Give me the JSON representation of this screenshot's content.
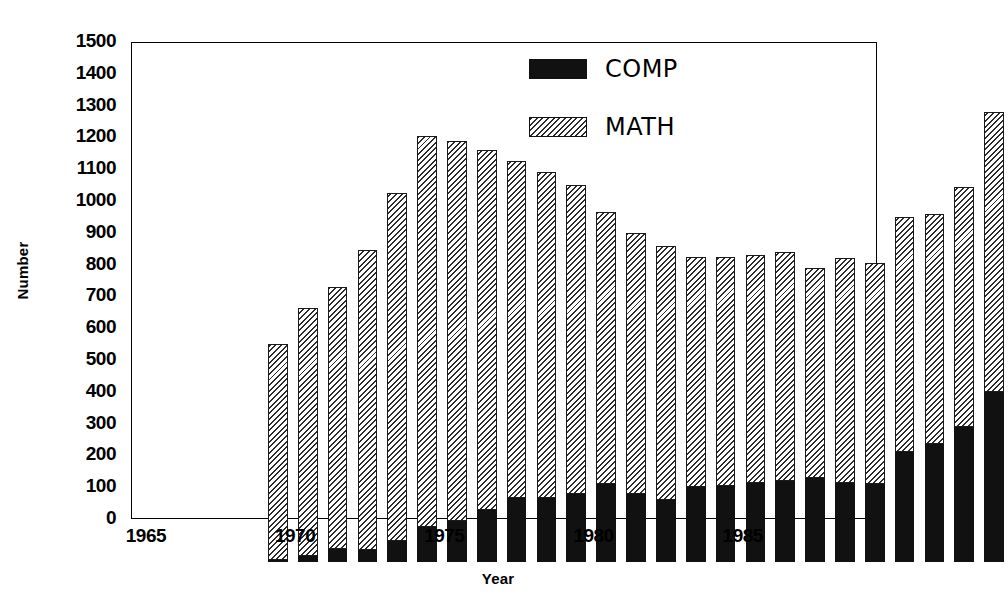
{
  "chart_data": {
    "type": "bar",
    "subtype": "stacked-vertical",
    "title": "",
    "xlabel": "Year",
    "ylabel": "Number",
    "ylim": [
      0,
      1500
    ],
    "ytick_step": 100,
    "yticks": [
      0,
      100,
      200,
      300,
      400,
      500,
      600,
      700,
      800,
      900,
      1000,
      1100,
      1200,
      1300,
      1400,
      1500
    ],
    "ytick_labels": [
      "0",
      "100",
      "200",
      "300",
      "400",
      "500",
      "600",
      "700",
      "800",
      "900",
      "1000",
      "1100",
      "1200",
      "1300",
      "1400",
      "1500"
    ],
    "xtick_labels": [
      "1965",
      "1970",
      "1975",
      "1980",
      "1985"
    ],
    "xtick_years": [
      1965,
      1970,
      1975,
      1980,
      1985
    ],
    "grid": false,
    "legend_position": "top-right",
    "categories": [
      1965,
      1966,
      1967,
      1968,
      1969,
      1970,
      1971,
      1972,
      1973,
      1974,
      1975,
      1976,
      1977,
      1978,
      1979,
      1980,
      1981,
      1982,
      1983,
      1984,
      1985,
      1986,
      1987,
      1988,
      1989
    ],
    "series": [
      {
        "name": "COMP",
        "color": "#111111",
        "pattern": "solid",
        "values": [
          5,
          20,
          40,
          38,
          65,
          110,
          130,
          165,
          200,
          200,
          215,
          245,
          215,
          195,
          235,
          240,
          250,
          255,
          265,
          250,
          245,
          345,
          370,
          425,
          535
        ]
      },
      {
        "name": "MATH",
        "color": "#2b2b2b",
        "pattern": "diagonal-hatch",
        "values": [
          680,
          780,
          825,
          942,
          1095,
          1230,
          1195,
          1130,
          1060,
          1025,
          970,
          855,
          820,
          800,
          725,
          720,
          715,
          720,
          660,
          705,
          695,
          740,
          725,
          755,
          880
        ]
      }
    ],
    "totals": [
      685,
      800,
      865,
      980,
      1160,
      1340,
      1325,
      1295,
      1260,
      1225,
      1185,
      1100,
      1035,
      995,
      960,
      960,
      965,
      975,
      925,
      955,
      940,
      1085,
      1095,
      1180,
      1415
    ],
    "legend": [
      {
        "label": "COMP",
        "swatch": "solid-black"
      },
      {
        "label": "MATH",
        "swatch": "diagonal-hatch"
      }
    ]
  }
}
